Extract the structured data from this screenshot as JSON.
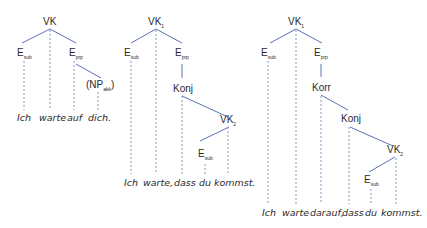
{
  "colors": {
    "edge": "#5a74b8",
    "projection": "#7a8cc0",
    "text": "#2a2a2a",
    "background": "#ffffff"
  },
  "trees": [
    {
      "id": "tree1",
      "root": {
        "label": "VK",
        "sub": ""
      },
      "nodes": [
        {
          "label": "E",
          "sub": "sub"
        },
        {
          "label": "E",
          "sub": "prp"
        },
        {
          "label": "(NP",
          "sub": "akk",
          "suffix": ")"
        }
      ],
      "words": [
        "Ich",
        "warte",
        "auf",
        "dich."
      ]
    },
    {
      "id": "tree2",
      "root": {
        "label": "VK",
        "sub": "1"
      },
      "nodes": [
        {
          "label": "E",
          "sub": "sub"
        },
        {
          "label": "E",
          "sub": "prp"
        },
        {
          "label": "Konj",
          "sub": ""
        },
        {
          "label": "VK",
          "sub": "2"
        },
        {
          "label": "E",
          "sub": "sub"
        }
      ],
      "words": [
        "Ich",
        "warte,",
        "dass",
        "du",
        "kommst."
      ]
    },
    {
      "id": "tree3",
      "root": {
        "label": "VK",
        "sub": "1"
      },
      "nodes": [
        {
          "label": "E",
          "sub": "sub"
        },
        {
          "label": "E",
          "sub": "prp"
        },
        {
          "label": "Korr",
          "sub": ""
        },
        {
          "label": "Konj",
          "sub": ""
        },
        {
          "label": "VK",
          "sub": "2"
        },
        {
          "label": "E",
          "sub": "sub"
        }
      ],
      "words": [
        "Ich",
        "warte",
        "darauf,",
        "dass",
        "du",
        "kommst."
      ]
    }
  ]
}
